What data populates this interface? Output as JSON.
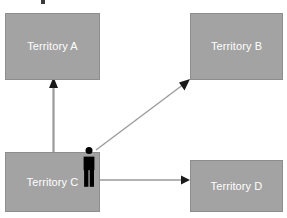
{
  "diagram": {
    "type": "territory-movement-diagram",
    "background_color": "#ffffff",
    "box_fill_color": "#a3a3a3",
    "box_border_color": "#8d8d8d",
    "label_color": "#ffffff",
    "arrow_shaft_color": "#9a9a9a",
    "arrow_head_color": "#1a1a1a",
    "figure_color": "#000000",
    "nodes": [
      {
        "id": "a",
        "label": "Territory A",
        "position": "top-left"
      },
      {
        "id": "b",
        "label": "Territory B",
        "position": "top-right"
      },
      {
        "id": "c",
        "label": "Territory C",
        "position": "bottom-left"
      },
      {
        "id": "d",
        "label": "Territory D",
        "position": "bottom-right"
      }
    ],
    "actor": {
      "name": "person-figure",
      "located_in": "Territory C"
    },
    "edges": [
      {
        "id": "c-to-a",
        "from": "Territory C",
        "to": "Territory A",
        "direction": "up"
      },
      {
        "id": "c-to-b",
        "from": "Territory C",
        "to": "Territory B",
        "direction": "diagonal-up-right"
      },
      {
        "id": "c-to-d",
        "from": "Territory C",
        "to": "Territory D",
        "direction": "right"
      }
    ]
  }
}
